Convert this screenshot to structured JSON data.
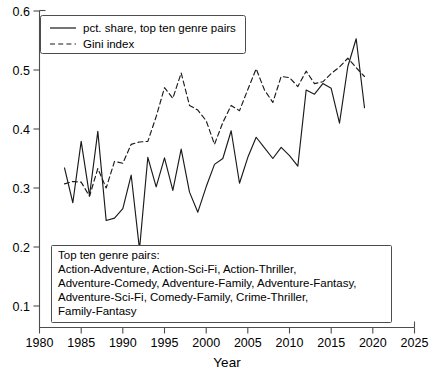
{
  "chart_data": {
    "type": "line",
    "title": "",
    "xlabel": "Year",
    "ylabel": "",
    "xlim": [
      1980,
      2025
    ],
    "ylim": [
      0.0,
      0.6
    ],
    "xticks": [
      1980,
      1985,
      1990,
      1995,
      2000,
      2005,
      2010,
      2015,
      2020,
      2025
    ],
    "yticks": [
      0.1,
      0.2,
      0.3,
      0.4,
      0.5,
      0.6
    ],
    "grid": false,
    "legend_position": "upper left",
    "x": [
      1983,
      1984,
      1985,
      1986,
      1987,
      1988,
      1989,
      1990,
      1991,
      1992,
      1993,
      1994,
      1995,
      1996,
      1997,
      1998,
      1999,
      2000,
      2001,
      2002,
      2003,
      2004,
      2005,
      2006,
      2007,
      2008,
      2009,
      2010,
      2011,
      2012,
      2013,
      2014,
      2015,
      2016,
      2017,
      2018,
      2019
    ],
    "series": [
      {
        "name": "pct. share, top ten genre pairs",
        "style": "solid",
        "color": "#1a1a1a",
        "values": [
          0.334,
          0.275,
          0.379,
          0.287,
          0.396,
          0.245,
          0.249,
          0.265,
          0.322,
          0.196,
          0.352,
          0.302,
          0.351,
          0.296,
          0.366,
          0.293,
          0.259,
          0.302,
          0.34,
          0.35,
          0.397,
          0.308,
          0.352,
          0.386,
          0.368,
          0.35,
          0.369,
          0.355,
          0.337,
          0.466,
          0.459,
          0.477,
          0.469,
          0.41,
          0.506,
          0.553,
          0.436
        ]
      },
      {
        "name": "Gini index",
        "style": "dashed",
        "color": "#1a1a1a",
        "values": [
          0.307,
          0.311,
          0.31,
          0.286,
          0.333,
          0.3,
          0.345,
          0.342,
          0.374,
          0.378,
          0.379,
          0.421,
          0.47,
          0.452,
          0.495,
          0.44,
          0.432,
          0.414,
          0.374,
          0.411,
          0.44,
          0.431,
          0.467,
          0.502,
          0.466,
          0.445,
          0.489,
          0.487,
          0.472,
          0.498,
          0.477,
          0.48,
          0.494,
          0.505,
          0.52,
          0.504,
          0.489
        ]
      }
    ],
    "annotations": [
      {
        "name": "top-ten-genre-pairs-note",
        "lines": [
          "Top ten genre pairs:",
          "Action-Adventure, Action-Sci-Fi, Action-Thriller,",
          "Adventure-Comedy, Adventure-Family, Adventure-Fantasy,",
          "Adventure-Sci-Fi, Comedy-Family, Crime-Thriller,",
          "Family-Fantasy"
        ]
      }
    ]
  },
  "axes": {
    "x_title": "Year",
    "x_tick_labels": [
      "1980",
      "1985",
      "1990",
      "1995",
      "2000",
      "2005",
      "2010",
      "2015",
      "2020",
      "2025"
    ],
    "y_tick_labels": [
      "0.1",
      "0.2",
      "0.3",
      "0.4",
      "0.5",
      "0.6"
    ]
  },
  "legend": {
    "entries": [
      {
        "label": "pct. share, top ten genre pairs",
        "style": "solid"
      },
      {
        "label": "Gini index",
        "style": "dashed"
      }
    ]
  },
  "note": {
    "line1": "Top ten genre pairs:",
    "line2": "Action-Adventure, Action-Sci-Fi, Action-Thriller,",
    "line3": "Adventure-Comedy, Adventure-Family, Adventure-Fantasy,",
    "line4": "Adventure-Sci-Fi, Comedy-Family, Crime-Thriller,",
    "line5": "Family-Fantasy"
  },
  "colors": {
    "line": "#1a1a1a",
    "axis": "#4d4d4d",
    "background": "#ffffff"
  }
}
